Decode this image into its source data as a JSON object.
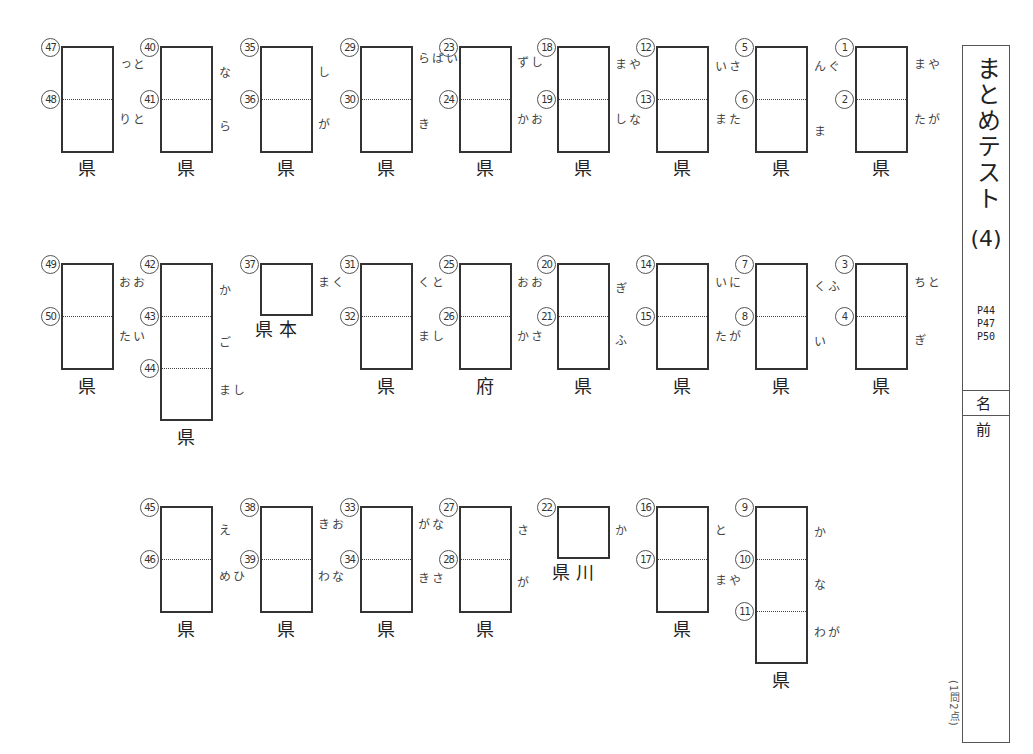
{
  "worksheet": {
    "title": "まとめテスト",
    "number": "(4)",
    "pages": [
      "P44",
      "P47",
      "P50"
    ],
    "name_label": "名 前",
    "name_value": "",
    "points_note": "(1問2点)"
  },
  "questions": [
    {
      "id": "yamagata",
      "nums": [
        "1",
        "2"
      ],
      "hints": [
        "やま",
        "がた"
      ],
      "suffix": "県"
    },
    {
      "id": "gunma",
      "nums": [
        "5",
        "6"
      ],
      "hints": [
        "ぐん",
        "ま"
      ],
      "suffix": "県"
    },
    {
      "id": "saitama",
      "nums": [
        "12",
        "13"
      ],
      "hints": [
        "さい",
        "たま"
      ],
      "suffix": "県"
    },
    {
      "id": "yamanashi",
      "nums": [
        "18",
        "19"
      ],
      "hints": [
        "やま",
        "なし"
      ],
      "suffix": "県"
    },
    {
      "id": "shizuoka",
      "nums": [
        "23",
        "24"
      ],
      "hints": [
        "しず",
        "おか"
      ],
      "suffix": "県"
    },
    {
      "id": "ibaraki",
      "nums": [
        "29",
        "30"
      ],
      "hints": [
        "いばら",
        "き"
      ],
      "suffix": "県"
    },
    {
      "id": "shiga",
      "nums": [
        "35",
        "36"
      ],
      "hints": [
        "し",
        "が"
      ],
      "suffix": "県"
    },
    {
      "id": "nara",
      "nums": [
        "40",
        "41"
      ],
      "hints": [
        "な",
        "ら"
      ],
      "suffix": "県"
    },
    {
      "id": "tottori",
      "nums": [
        "47",
        "48"
      ],
      "hints": [
        "とっ",
        "とり"
      ],
      "suffix": "県"
    },
    {
      "id": "tochigi",
      "nums": [
        "3",
        "4"
      ],
      "hints": [
        "とち",
        "ぎ"
      ],
      "suffix": "県"
    },
    {
      "id": "fukui",
      "nums": [
        "7",
        "8"
      ],
      "hints": [
        "ふく",
        "い"
      ],
      "suffix": "県"
    },
    {
      "id": "niigata",
      "nums": [
        "14",
        "15"
      ],
      "hints": [
        "にい",
        "がた"
      ],
      "suffix": "県"
    },
    {
      "id": "gifu",
      "nums": [
        "20",
        "21"
      ],
      "hints": [
        "ぎ",
        "ふ"
      ],
      "suffix": "県"
    },
    {
      "id": "osaka",
      "nums": [
        "25",
        "26"
      ],
      "hints": [
        "おお",
        "さか"
      ],
      "suffix": "府"
    },
    {
      "id": "tokushima",
      "nums": [
        "31",
        "32"
      ],
      "hints": [
        "とく",
        "しま"
      ],
      "suffix": "県"
    },
    {
      "id": "kumamoto",
      "nums": [
        "37"
      ],
      "hints": [
        "くま"
      ],
      "suffix": "本県"
    },
    {
      "id": "kagoshima",
      "nums": [
        "42",
        "43",
        "44"
      ],
      "hints": [
        "か",
        "ご",
        "しま"
      ],
      "suffix": "県"
    },
    {
      "id": "oita",
      "nums": [
        "49",
        "50"
      ],
      "hints": [
        "おお",
        "いた"
      ],
      "suffix": "県"
    },
    {
      "id": "kanagawa",
      "nums": [
        "9",
        "10",
        "11"
      ],
      "hints": [
        "か",
        "な",
        "がわ"
      ],
      "suffix": "県"
    },
    {
      "id": "toyama",
      "nums": [
        "16",
        "17"
      ],
      "hints": [
        "と",
        "やま"
      ],
      "suffix": "県"
    },
    {
      "id": "kagawa",
      "nums": [
        "22"
      ],
      "hints": [
        "か"
      ],
      "suffix": "川県"
    },
    {
      "id": "saga",
      "nums": [
        "27",
        "28"
      ],
      "hints": [
        "さ",
        "が"
      ],
      "suffix": "県"
    },
    {
      "id": "nagasaki",
      "nums": [
        "33",
        "34"
      ],
      "hints": [
        "なが",
        "さき"
      ],
      "suffix": "県"
    },
    {
      "id": "okinawa",
      "nums": [
        "38",
        "39"
      ],
      "hints": [
        "おき",
        "なわ"
      ],
      "suffix": "県"
    },
    {
      "id": "ehime",
      "nums": [
        "45",
        "46"
      ],
      "hints": [
        "え",
        "ひめ"
      ],
      "suffix": "県"
    }
  ]
}
